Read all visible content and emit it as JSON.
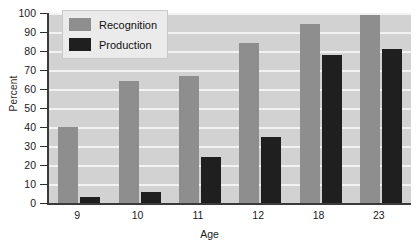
{
  "chart_data": {
    "type": "bar",
    "title": "",
    "xlabel": "Age",
    "ylabel": "Percent",
    "categories": [
      "9",
      "10",
      "11",
      "12",
      "18",
      "23"
    ],
    "series": [
      {
        "name": "Recognition",
        "color": "#8e8e8e",
        "values": [
          40,
          64,
          67,
          84,
          94,
          99
        ]
      },
      {
        "name": "Production",
        "color": "#1f1f1f",
        "values": [
          3,
          6,
          24,
          35,
          78,
          81
        ]
      }
    ],
    "ylim": [
      0,
      100
    ],
    "yticks": [
      0,
      10,
      20,
      30,
      40,
      50,
      60,
      70,
      80,
      90,
      100
    ],
    "ytick_labels": [
      "0",
      "10",
      "20",
      "30",
      "40",
      "50",
      "60",
      "70",
      "80",
      "90",
      "100"
    ],
    "grid": true,
    "grid_axis": "y",
    "legend_position": "upper left",
    "plot_background": "#d2d2d2",
    "gridline_color": "#f2f2f2",
    "axis_color": "#3a3a3a"
  }
}
